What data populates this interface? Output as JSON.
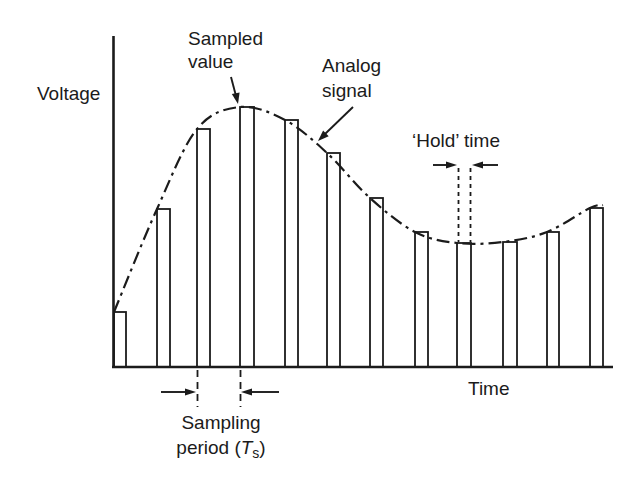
{
  "labels": {
    "y_axis": "Voltage",
    "x_axis": "Time",
    "sampled_value_line1": "Sampled",
    "sampled_value_line2": "value",
    "analog_signal_line1": "Analog",
    "analog_signal_line2": "signal",
    "hold_time": "‘Hold’ time",
    "sampling_line1": "Sampling",
    "sampling_period_prefix": "period (",
    "sampling_period_symbol": "T",
    "sampling_period_subscript": "s",
    "sampling_period_suffix": ")"
  },
  "colors": {
    "ink": "#1b1b1b",
    "background": "#ffffff"
  },
  "chart_data": {
    "type": "sample-and-hold diagram: outlined bars (held samples) under a dash-dot analog signal curve",
    "xlabel": "Time",
    "ylabel": "Voltage",
    "grid": false,
    "legend": false,
    "axis": {
      "y_axis_x": 113.5,
      "y_top": 36,
      "baseline_y": 367,
      "x_start": 112,
      "x_end": 613
    },
    "bars": [
      {
        "x": 114,
        "w": 12,
        "top": 312
      },
      {
        "x": 157,
        "w": 13,
        "top": 209
      },
      {
        "x": 197,
        "w": 13,
        "top": 129
      },
      {
        "x": 240,
        "w": 14,
        "top": 107
      },
      {
        "x": 285,
        "w": 13,
        "top": 120
      },
      {
        "x": 327,
        "w": 13,
        "top": 153
      },
      {
        "x": 370,
        "w": 13,
        "top": 198
      },
      {
        "x": 415,
        "w": 13,
        "top": 232
      },
      {
        "x": 457,
        "w": 14,
        "top": 243
      },
      {
        "x": 503,
        "w": 14,
        "top": 242
      },
      {
        "x": 547,
        "w": 12,
        "top": 232
      },
      {
        "x": 590,
        "w": 13,
        "top": 208
      }
    ],
    "curve_points": [
      [
        114,
        312
      ],
      [
        157,
        209
      ],
      [
        197,
        129
      ],
      [
        240,
        107
      ],
      [
        285,
        120
      ],
      [
        327,
        153
      ],
      [
        370,
        198
      ],
      [
        415,
        232
      ],
      [
        457,
        243
      ],
      [
        503,
        242
      ],
      [
        547,
        232
      ],
      [
        590,
        208
      ],
      [
        603,
        205
      ]
    ],
    "hold_marks": {
      "x_left": 458.5,
      "x_right": 470.5,
      "y_top": 168,
      "y_bottom": 242
    },
    "period_marks": {
      "x_left": 197.5,
      "x_right": 240.5,
      "y_top": 370,
      "y_bottom": 407
    }
  }
}
